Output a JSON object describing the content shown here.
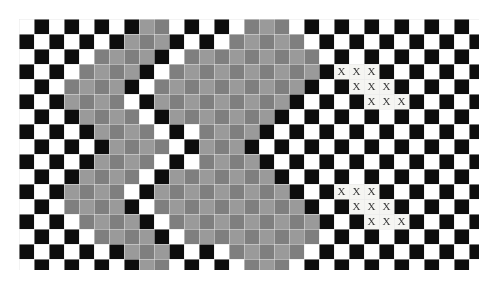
{
  "figure": {
    "type": "stimulus-image",
    "canvas": {
      "width": 497,
      "height": 287,
      "background": "#ffffff"
    },
    "grid": {
      "origin_x": 19,
      "origin_y": 19,
      "cell_size": 15,
      "columns": 31,
      "rows": 17,
      "clip_width": 460,
      "clip_height": 251,
      "gridline_color": "#e8e8e8",
      "gridline_width": 0.5
    },
    "palette": {
      "white": "#ffffff",
      "black": "#0d0d0d",
      "gray_dark": "#7f7f7f",
      "gray_light": "#9a9a9a",
      "mark_color": "#3a3a3a",
      "mark_cell_background": "#f5f5f2"
    },
    "mark": {
      "glyph": "X",
      "font_size": 11
    },
    "mark_groups": [
      {
        "name": "upper-x-staircase",
        "rows": [
          {
            "row": 3,
            "cols": [
              21,
              22,
              23
            ]
          },
          {
            "row": 4,
            "cols": [
              22,
              23,
              24
            ]
          },
          {
            "row": 5,
            "cols": [
              23,
              24,
              25
            ]
          }
        ]
      },
      {
        "name": "lower-x-staircase",
        "rows": [
          {
            "row": 11,
            "cols": [
              21,
              22,
              23
            ]
          },
          {
            "row": 12,
            "cols": [
              22,
              23,
              24
            ]
          },
          {
            "row": 13,
            "cols": [
              23,
              24,
              25
            ]
          }
        ]
      }
    ],
    "gray_regions": {
      "description": "Two vertically stacked lobe-shaped regions on the left half where checkerboard squares are replaced by mid-gray.",
      "lobes": [
        {
          "name": "upper-lobe",
          "center_col": 9,
          "center_row": 4,
          "radius_col": 7,
          "radius_row": 4
        },
        {
          "name": "lower-lobe",
          "center_col": 9,
          "center_row": 12,
          "radius_col": 7,
          "radius_row": 4
        }
      ]
    },
    "gray_cells": [
      {
        "row": 0,
        "cols": [
          8,
          9,
          15,
          16,
          17
        ]
      },
      {
        "row": 1,
        "cols": [
          7,
          8,
          9,
          14,
          15,
          16,
          17,
          18
        ]
      },
      {
        "row": 2,
        "cols": [
          5,
          6,
          7,
          8,
          11,
          12,
          13,
          14,
          15,
          16,
          17,
          18,
          19
        ]
      },
      {
        "row": 3,
        "cols": [
          4,
          5,
          6,
          7,
          10,
          11,
          12,
          13,
          14,
          15,
          16,
          17,
          18,
          19
        ]
      },
      {
        "row": 4,
        "cols": [
          3,
          4,
          5,
          6,
          9,
          10,
          11,
          12,
          13,
          14,
          15,
          16,
          17,
          18
        ]
      },
      {
        "row": 5,
        "cols": [
          3,
          4,
          5,
          6,
          9,
          10,
          11,
          12,
          13,
          14,
          15,
          16,
          17
        ]
      },
      {
        "row": 6,
        "cols": [
          4,
          5,
          6,
          7,
          10,
          11,
          12,
          13,
          14,
          15,
          16
        ]
      },
      {
        "row": 7,
        "cols": [
          5,
          6,
          7,
          8,
          12,
          13,
          14,
          15
        ]
      },
      {
        "row": 8,
        "cols": [
          6,
          7,
          8,
          9,
          12,
          13,
          14
        ]
      },
      {
        "row": 9,
        "cols": [
          5,
          6,
          7,
          8,
          12,
          13,
          14,
          15
        ]
      },
      {
        "row": 10,
        "cols": [
          4,
          5,
          6,
          7,
          10,
          11,
          12,
          13,
          14,
          15,
          16
        ]
      },
      {
        "row": 11,
        "cols": [
          3,
          4,
          5,
          6,
          9,
          10,
          11,
          12,
          13,
          14,
          15,
          16,
          17
        ]
      },
      {
        "row": 12,
        "cols": [
          3,
          4,
          5,
          6,
          9,
          10,
          11,
          12,
          13,
          14,
          15,
          16,
          17,
          18
        ]
      },
      {
        "row": 13,
        "cols": [
          4,
          5,
          6,
          7,
          10,
          11,
          12,
          13,
          14,
          15,
          16,
          17,
          18,
          19
        ]
      },
      {
        "row": 14,
        "cols": [
          5,
          6,
          7,
          8,
          11,
          12,
          13,
          14,
          15,
          16,
          17,
          18,
          19
        ]
      },
      {
        "row": 15,
        "cols": [
          7,
          8,
          9,
          14,
          15,
          16,
          17,
          18
        ]
      },
      {
        "row": 16,
        "cols": [
          8,
          9,
          15,
          16,
          17
        ]
      }
    ]
  }
}
